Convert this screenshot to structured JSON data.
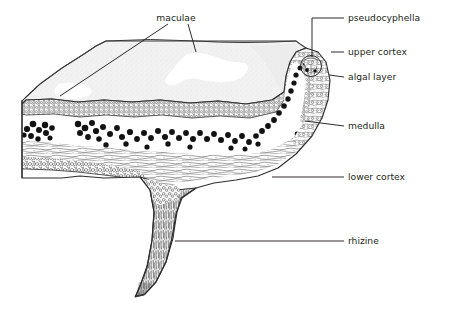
{
  "figure": {
    "background_color": "#ffffff",
    "ink_color": "#231f20",
    "surface_fill": "#f0f0f0",
    "macula_fill": "#ffffff",
    "algal_cell_color": "#111111"
  },
  "labels": [
    {
      "id": "maculae",
      "text": "maculae",
      "text_x": 176,
      "text_y": 18,
      "anchor": "middle",
      "leader_type": "forked",
      "leaders": [
        [
          [
            168,
            24
          ],
          [
            60,
            96
          ]
        ],
        [
          [
            188,
            24
          ],
          [
            196,
            52
          ]
        ]
      ]
    },
    {
      "id": "pseudocyphella",
      "text": "pseudocyphella",
      "text_x": 348,
      "text_y": 18,
      "anchor": "start",
      "leader_type": "elbow",
      "leaders": [
        [
          [
            344,
            18
          ],
          [
            312,
            18
          ],
          [
            312,
            57
          ]
        ]
      ]
    },
    {
      "id": "upper-cortex",
      "text": "upper cortex",
      "text_x": 348,
      "text_y": 52,
      "anchor": "start",
      "leader_type": "dash",
      "leaders": [
        [
          [
            344,
            52
          ],
          [
            331,
            52
          ]
        ]
      ]
    },
    {
      "id": "algal-layer",
      "text": "algal layer",
      "text_x": 348,
      "text_y": 77,
      "anchor": "start",
      "leader_type": "dash",
      "leaders": [
        [
          [
            344,
            77
          ],
          [
            329,
            75
          ]
        ]
      ]
    },
    {
      "id": "medulla",
      "text": "medulla",
      "text_x": 348,
      "text_y": 126,
      "anchor": "start",
      "leader_type": "slant",
      "leaders": [
        [
          [
            344,
            126
          ],
          [
            305,
            121
          ]
        ]
      ]
    },
    {
      "id": "lower-cortex",
      "text": "lower cortex",
      "text_x": 348,
      "text_y": 177,
      "anchor": "start",
      "leader_type": "line",
      "leaders": [
        [
          [
            344,
            177
          ],
          [
            272,
            177
          ]
        ]
      ]
    },
    {
      "id": "rhizine",
      "text": "rhizine",
      "text_x": 348,
      "text_y": 241,
      "anchor": "start",
      "leader_type": "line",
      "leaders": [
        [
          [
            344,
            241
          ],
          [
            175,
            241
          ]
        ]
      ]
    }
  ],
  "structures": [
    {
      "id": "upper-surface",
      "name": "upper surface plane"
    },
    {
      "id": "macula-patch",
      "name": "macula (pale blotch)"
    },
    {
      "id": "upper-cortex-band",
      "name": "upper cortex layer"
    },
    {
      "id": "algal-layer-band",
      "name": "algal layer"
    },
    {
      "id": "medulla-band",
      "name": "medulla layer"
    },
    {
      "id": "lower-cortex-band",
      "name": "lower cortex layer"
    },
    {
      "id": "rhizine-body",
      "name": "rhizine"
    },
    {
      "id": "pseudocyphella-pore",
      "name": "pseudocyphella pore"
    }
  ]
}
